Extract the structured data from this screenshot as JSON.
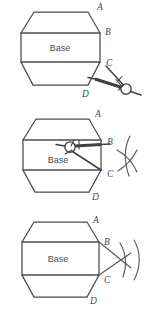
{
  "figure": {
    "background_color": "#ffffff",
    "stroke_color": "#4c4c52",
    "label_color": "#4a4a50",
    "width": 152,
    "height": 319
  },
  "panels": [
    {
      "id": "panel-1",
      "step": "1",
      "caption": "",
      "base_label": "Base",
      "vertex_labels": [
        {
          "key": "A",
          "text": "A",
          "x": 97,
          "y": 10
        },
        {
          "key": "B",
          "text": "B",
          "x": 105,
          "y": 35
        },
        {
          "key": "C",
          "text": "C",
          "x": 106,
          "y": 66
        },
        {
          "key": "D",
          "text": "D",
          "x": 82,
          "y": 97
        }
      ],
      "tool": "compass",
      "compass_visible": true,
      "arcs_visible": false,
      "compass_position": "outside-lower-right",
      "compass_pivot": {
        "x": 126,
        "y": 89
      }
    },
    {
      "id": "panel-2",
      "step": "2",
      "caption": "",
      "base_label": "Base",
      "vertex_labels": [
        {
          "key": "A",
          "text": "A",
          "x": 95,
          "y": 117
        },
        {
          "key": "B",
          "text": "B",
          "x": 107,
          "y": 145
        },
        {
          "key": "C",
          "text": "C",
          "x": 107,
          "y": 177
        },
        {
          "key": "D",
          "text": "D",
          "x": 92,
          "y": 200
        }
      ],
      "tool": "compass",
      "compass_visible": true,
      "arcs_visible": true,
      "compass_position": "inside-base",
      "compass_pivot": {
        "x": 70,
        "y": 147
      }
    },
    {
      "id": "panel-3",
      "step": "3",
      "caption": "",
      "base_label": "Base",
      "vertex_labels": [
        {
          "key": "A",
          "text": "A",
          "x": 93,
          "y": 223
        },
        {
          "key": "B",
          "text": "B",
          "x": 104,
          "y": 245
        },
        {
          "key": "C",
          "text": "C",
          "x": 104,
          "y": 283
        },
        {
          "key": "D",
          "text": "D",
          "x": 90,
          "y": 304
        }
      ],
      "tool": "none",
      "compass_visible": false,
      "arcs_visible": true,
      "rays_visible": true,
      "compass_position": "",
      "compass_pivot": {
        "x": 0,
        "y": 0
      }
    }
  ],
  "icons": {
    "compass": "compass-icon",
    "arc": "arc-icon",
    "octagon": "octagon-icon"
  }
}
